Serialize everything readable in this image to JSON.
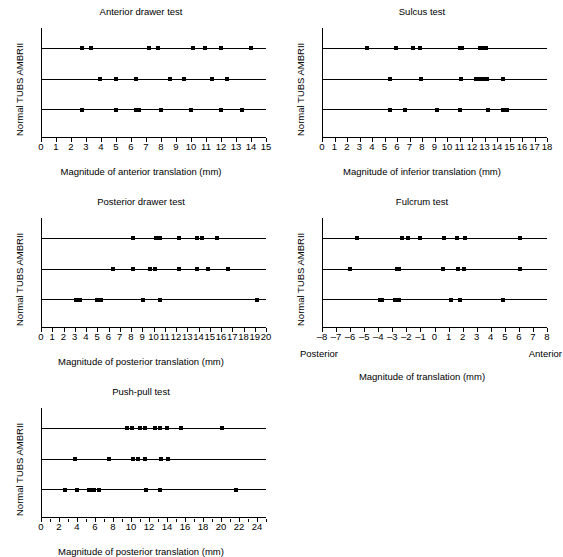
{
  "figure": {
    "y_axis_label": "Normal TUBS AMBRII",
    "categories": [
      "AMBRII",
      "TUBS",
      "Normal"
    ]
  },
  "chart_data": [
    {
      "type": "scatter",
      "id": "anterior-drawer-test",
      "title": "Anterior drawer test",
      "xlabel": "Magnitude of anterior translation (mm)",
      "ylabel": "Normal TUBS AMBRII",
      "xlim": [
        0,
        15
      ],
      "xticks": [
        0,
        1,
        2,
        3,
        4,
        5,
        6,
        7,
        8,
        9,
        10,
        11,
        12,
        13,
        14,
        15
      ],
      "xticklabels": [
        "0",
        "1",
        "2",
        "3",
        "4",
        "5",
        "6",
        "7",
        "8",
        "9",
        "10",
        "11",
        "12",
        "13",
        "14",
        "15"
      ],
      "grid": false,
      "legend": "none",
      "categories": [
        "AMBRII",
        "TUBS",
        "Normal"
      ],
      "series": [
        {
          "name": "AMBRII",
          "values": [
            2.7,
            3.3,
            7.2,
            7.8,
            10.1,
            10.9,
            12.0,
            14.0
          ]
        },
        {
          "name": "TUBS",
          "values": [
            3.9,
            5.0,
            6.3,
            8.6,
            9.5,
            11.4,
            12.4
          ]
        },
        {
          "name": "Normal",
          "values": [
            2.7,
            5.0,
            6.3,
            6.5,
            8.0,
            10.0,
            12.0,
            13.4
          ]
        }
      ]
    },
    {
      "type": "scatter",
      "id": "sulcus-test",
      "title": "Sulcus test",
      "xlabel": "Magnitude of inferior translation (mm)",
      "ylabel": "Normal TUBS AMBRII",
      "xlim": [
        0,
        18
      ],
      "xticks": [
        0,
        1,
        2,
        3,
        4,
        5,
        6,
        7,
        8,
        9,
        10,
        11,
        12,
        13,
        14,
        15,
        16,
        17,
        18
      ],
      "xticklabels": [
        "0",
        "1",
        "2",
        "3",
        "4",
        "5",
        "6",
        "7",
        "8",
        "9",
        "10",
        "11",
        "12",
        "13",
        "14",
        "15",
        "16",
        "17",
        "18"
      ],
      "grid": false,
      "legend": "none",
      "categories": [
        "AMBRII",
        "TUBS",
        "Normal"
      ],
      "series": [
        {
          "name": "AMBRII",
          "values": [
            3.6,
            5.9,
            7.3,
            7.8,
            11.0,
            11.2,
            12.6,
            12.9,
            13.1
          ]
        },
        {
          "name": "TUBS",
          "values": [
            5.4,
            7.9,
            11.1,
            12.3,
            12.6,
            12.9,
            13.2,
            14.5
          ]
        },
        {
          "name": "Normal",
          "values": [
            5.4,
            6.6,
            9.2,
            11.0,
            13.3,
            14.5,
            14.8
          ]
        }
      ]
    },
    {
      "type": "scatter",
      "id": "posterior-drawer-test",
      "title": "Posterior drawer test",
      "xlabel": "Magnitude of posterior translation (mm)",
      "ylabel": "Normal TUBS AMBRII",
      "xlim": [
        0,
        20
      ],
      "xticks": [
        0,
        1,
        2,
        3,
        4,
        5,
        6,
        7,
        8,
        9,
        10,
        11,
        12,
        13,
        14,
        15,
        16,
        17,
        18,
        19,
        20
      ],
      "xticklabels": [
        "0",
        "1",
        "2",
        "3",
        "4",
        "5",
        "6",
        "7",
        "8",
        "9",
        "10",
        "11",
        "12",
        "13",
        "14",
        "15",
        "16",
        "17",
        "18",
        "19",
        "20"
      ],
      "grid": false,
      "legend": "none",
      "categories": [
        "AMBRII",
        "TUBS",
        "Normal"
      ],
      "series": [
        {
          "name": "AMBRII",
          "values": [
            8.2,
            10.2,
            10.6,
            12.3,
            13.9,
            14.3,
            15.6
          ]
        },
        {
          "name": "TUBS",
          "values": [
            6.4,
            8.2,
            9.7,
            10.1,
            12.3,
            13.9,
            14.8,
            16.6
          ]
        },
        {
          "name": "Normal",
          "values": [
            3.1,
            3.3,
            3.5,
            5.0,
            5.3,
            9.1,
            10.6,
            19.2
          ]
        }
      ]
    },
    {
      "type": "scatter",
      "id": "fulcrum-test",
      "title": "Fulcrum test",
      "xlabel": "Magnitude of translation (mm)",
      "ylabel": "Normal TUBS AMBRII",
      "xlim": [
        -8,
        8
      ],
      "xticks": [
        -8,
        -7,
        -6,
        -5,
        -4,
        -3,
        -2,
        -1,
        0,
        1,
        2,
        3,
        4,
        5,
        6,
        7,
        8
      ],
      "xticklabels": [
        "–8",
        "–7",
        "–6",
        "–5",
        "–4",
        "–3",
        "–2",
        "–1",
        "0",
        "1",
        "2",
        "3",
        "4",
        "5",
        "6",
        "7",
        "8"
      ],
      "left_end_label": "Posterior",
      "right_end_label": "Anterior",
      "grid": false,
      "legend": "none",
      "categories": [
        "AMBRII",
        "TUBS",
        "Normal"
      ],
      "series": [
        {
          "name": "AMBRII",
          "values": [
            -5.5,
            -2.3,
            -1.9,
            -1.0,
            0.7,
            1.6,
            2.2,
            6.1
          ]
        },
        {
          "name": "TUBS",
          "values": [
            -6.0,
            -2.7,
            -2.5,
            0.6,
            1.7,
            2.1,
            6.1
          ]
        },
        {
          "name": "Normal",
          "values": [
            -3.9,
            -3.7,
            -2.8,
            -2.5,
            1.2,
            1.8,
            4.9
          ]
        }
      ]
    },
    {
      "type": "scatter",
      "id": "push-pull-test",
      "title": "Push-pull test",
      "xlabel": "Magnitude of posterior translation (mm)",
      "ylabel": "Normal TUBS AMBRII",
      "xlim": [
        0,
        25
      ],
      "xticks": [
        0,
        2,
        4,
        6,
        8,
        10,
        12,
        14,
        16,
        18,
        20,
        22,
        24
      ],
      "xticklabels": [
        "0",
        "2",
        "4",
        "6",
        "8",
        "10",
        "12",
        "14",
        "16",
        "18",
        "20",
        "22",
        "24"
      ],
      "grid": false,
      "legend": "none",
      "categories": [
        "AMBRII",
        "TUBS",
        "Normal"
      ],
      "series": [
        {
          "name": "AMBRII",
          "values": [
            9.6,
            10.1,
            11.0,
            11.5,
            12.7,
            13.2,
            14.0,
            15.6,
            20.1
          ]
        },
        {
          "name": "TUBS",
          "values": [
            3.8,
            7.6,
            10.2,
            10.8,
            11.5,
            13.3,
            14.1
          ]
        },
        {
          "name": "Normal",
          "values": [
            2.7,
            4.0,
            5.3,
            5.6,
            5.9,
            6.4,
            11.7,
            13.2,
            21.7
          ]
        }
      ]
    }
  ]
}
